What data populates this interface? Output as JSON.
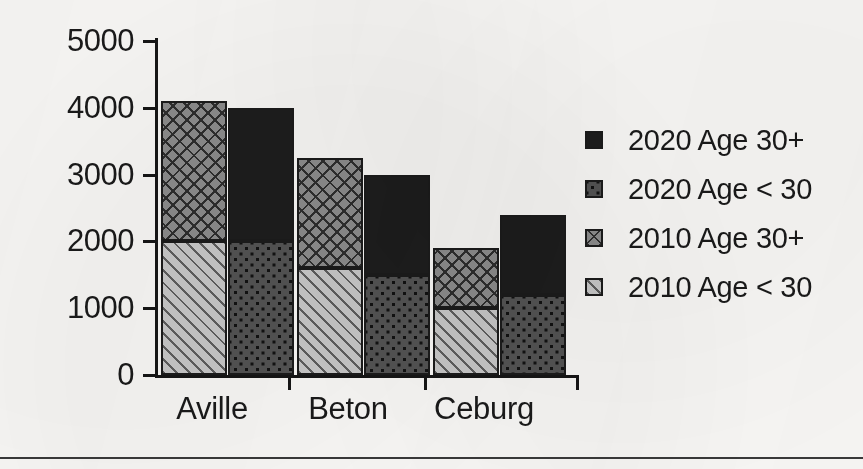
{
  "chart_data": {
    "type": "bar",
    "subtype": "grouped-stacked",
    "title": "",
    "xlabel": "",
    "ylabel": "",
    "ylim": [
      0,
      5000
    ],
    "ytick_labels": [
      "5000",
      "4000",
      "3000",
      "2000",
      "1000",
      "0"
    ],
    "ytick_values": [
      5000,
      4000,
      3000,
      2000,
      1000,
      0
    ],
    "grid": false,
    "legend_position": "right",
    "categories": [
      "Aville",
      "Beton",
      "Ceburg"
    ],
    "groups": [
      "2010",
      "2020"
    ],
    "series": [
      {
        "name": "2020 Age 30+",
        "group": "2020",
        "pattern": "solid-black",
        "values": [
          2000,
          1500,
          1200
        ]
      },
      {
        "name": "2020 Age < 30",
        "group": "2020",
        "pattern": "dotted",
        "values": [
          2000,
          1500,
          1200
        ]
      },
      {
        "name": "2010 Age 30+",
        "group": "2010",
        "pattern": "crosshatch",
        "values": [
          2100,
          1650,
          900
        ]
      },
      {
        "name": "2010 Age < 30",
        "group": "2010",
        "pattern": "diagonal-stripe",
        "values": [
          2000,
          1600,
          1000
        ]
      }
    ],
    "totals": {
      "2010": [
        4100,
        3250,
        1900
      ],
      "2020": [
        4000,
        3000,
        2400
      ]
    }
  },
  "axis": {
    "y_ticks": [
      {
        "label": "5000",
        "value": 5000
      },
      {
        "label": "4000",
        "value": 4000
      },
      {
        "label": "3000",
        "value": 3000
      },
      {
        "label": "2000",
        "value": 2000
      },
      {
        "label": "1000",
        "value": 1000
      },
      {
        "label": "0",
        "value": 0
      }
    ],
    "x_categories": [
      {
        "label": "Aville"
      },
      {
        "label": "Beton"
      },
      {
        "label": "Ceburg"
      }
    ]
  },
  "legend": {
    "items": [
      {
        "label": "2020 Age 30+",
        "pattern": "solid-black"
      },
      {
        "label": "2020 Age < 30",
        "pattern": "dotted"
      },
      {
        "label": "2010 Age 30+",
        "pattern": "crosshatch"
      },
      {
        "label": "2010 Age < 30",
        "pattern": "diagonal-stripe"
      }
    ]
  },
  "colors": {
    "ink": "#1a1a1a",
    "paper": "#fbfaf8",
    "solid_black": "#1d1d1d",
    "dotted_fill": "#545454",
    "crosshatch_fill": "#8d8d8d",
    "stripe_fill": "#c9c9c9"
  }
}
